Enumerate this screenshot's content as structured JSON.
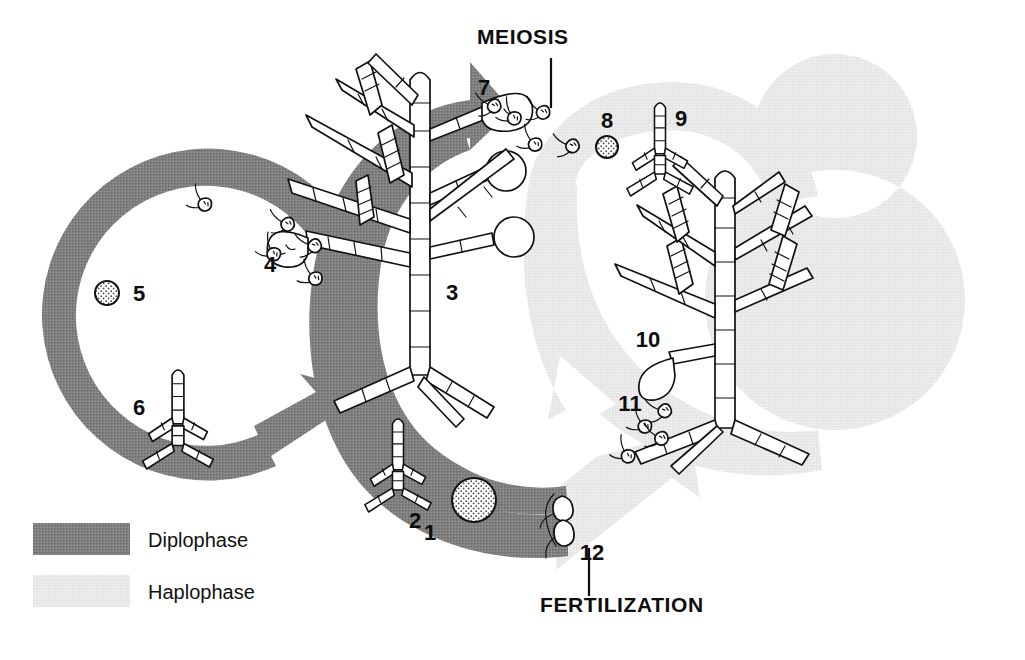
{
  "colors": {
    "diplophase": "#808080",
    "haplophase": "#e9e9e9",
    "ink": "#111111",
    "background": "#ffffff",
    "cell_fill": "#ffffff"
  },
  "process_labels": [
    {
      "id": "meiosis",
      "text": "MEIOSIS",
      "x": 517,
      "y": 42,
      "leader": {
        "x1": 551,
        "y1": 55,
        "x2": 551,
        "y2": 105
      }
    },
    {
      "id": "fertilization",
      "text": "FERTILIZATION",
      "x": 616,
      "y": 607,
      "leader": {
        "x1": 589,
        "y1": 597,
        "x2": 589,
        "y2": 545
      }
    }
  ],
  "legend": {
    "name": "phase-legend",
    "items": [
      {
        "id": "diplophase",
        "label": "Diplophase",
        "swatch": "#808080",
        "swatch_x": 33,
        "swatch_y": 523,
        "swatch_w": 97,
        "swatch_h": 32,
        "text_x": 148,
        "text_y": 546
      },
      {
        "id": "haplophase",
        "label": "Haplophase",
        "swatch": "#e9e9e9",
        "swatch_x": 33,
        "swatch_y": 575,
        "swatch_w": 97,
        "swatch_h": 32,
        "text_x": 148,
        "text_y": 598
      }
    ]
  },
  "stage_numbers": [
    {
      "n": "1",
      "x": 432,
      "y": 533,
      "phase": "diplophase",
      "meaning": "zygote"
    },
    {
      "n": "2",
      "x": 414,
      "y": 524,
      "phase": "diplophase",
      "meaning": "young sporophyte germling"
    },
    {
      "n": "3",
      "x": 450,
      "y": 298,
      "phase": "diplophase",
      "meaning": "mature sporophyte"
    },
    {
      "n": "4",
      "x": 267,
      "y": 266,
      "phase": "diplophase",
      "meaning": "zoospores from plurilocular sporangium"
    },
    {
      "n": "5",
      "x": 136,
      "y": 299,
      "phase": "diplophase",
      "meaning": "settled zoospore"
    },
    {
      "n": "6",
      "x": 136,
      "y": 410,
      "phase": "diplophase",
      "meaning": "new sporophyte germling"
    },
    {
      "n": "7",
      "x": 482,
      "y": 89,
      "phase": "diplophase",
      "meaning": "meiospores from unilocular sporangium"
    },
    {
      "n": "8",
      "x": 606,
      "y": 122,
      "phase": "haplophase",
      "meaning": "settled meiospore"
    },
    {
      "n": "9",
      "x": 680,
      "y": 120,
      "phase": "haplophase",
      "meaning": "young gametophyte germling"
    },
    {
      "n": "10",
      "x": 645,
      "y": 341,
      "phase": "haplophase",
      "meaning": "mature gametophyte"
    },
    {
      "n": "11",
      "x": 628,
      "y": 405,
      "phase": "haplophase",
      "meaning": "gametes released"
    },
    {
      "n": "12",
      "x": 588,
      "y": 553,
      "phase": "fertilization",
      "meaning": "fusing gametes / syngamy"
    }
  ],
  "bands": {
    "diplophase_ring": {
      "name": "diplophase-arrow-ring",
      "cx": 205,
      "cy": 330,
      "r": 130,
      "thickness": 48
    },
    "diplophase_sweep": {
      "name": "diplophase-arrow-sweep",
      "cx": 440,
      "cy": 300,
      "r": 175,
      "thickness": 56
    },
    "haplophase_ring": {
      "name": "haplophase-arrow-ring",
      "cx": 835,
      "cy": 300,
      "r": 130,
      "thickness": 48
    },
    "haplophase_sweep": {
      "name": "haplophase-arrow-sweep",
      "cx": 640,
      "cy": 290,
      "r": 175,
      "thickness": 56
    }
  }
}
